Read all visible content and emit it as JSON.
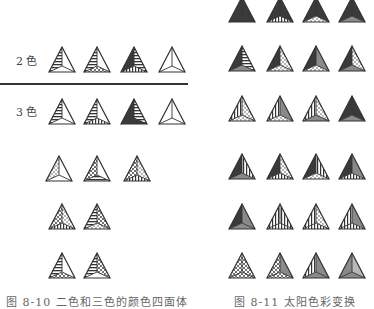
{
  "figure_left": {
    "rows": [
      {
        "label": "2 色",
        "count": 4
      },
      {
        "label": "3 色",
        "count": 4
      }
    ],
    "lower_groups_counts": [
      3,
      2,
      2
    ],
    "caption": "图 8-10 二色和三色的颜色四面体"
  },
  "figure_right": {
    "rows": 6,
    "per_row": 4,
    "caption": "图 8-11 太阳色彩变换"
  },
  "colors": {
    "ink": "#333333",
    "dark_fill": "#3a3a3a",
    "mid_fill": "#8a8a8a",
    "light_fill": "#b8b8b8",
    "paper": "#ffffff"
  }
}
